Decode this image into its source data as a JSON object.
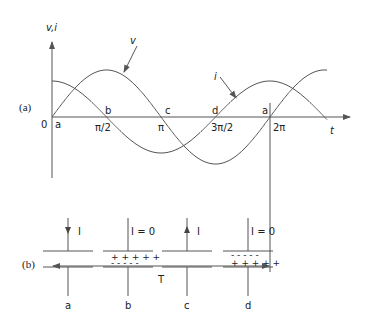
{
  "figure": {
    "part_a": {
      "label": "(a)",
      "y_axis_label": "v,i",
      "x_axis_label": "t",
      "origin_label": "0",
      "curve_labels": {
        "voltage": "v",
        "current": "i"
      },
      "x_ticks": [
        "π/2",
        "π",
        "3π/2",
        "2π"
      ],
      "point_labels": [
        "a",
        "b",
        "c",
        "d",
        "a"
      ],
      "period_label": "T"
    },
    "part_b": {
      "label": "(b)",
      "capacitors": [
        {
          "name": "a",
          "current_label": "I",
          "arrow": "down",
          "top_charges": "",
          "bottom_charges": ""
        },
        {
          "name": "b",
          "current_label": "I = 0",
          "arrow": "none",
          "top_charges": "+ + + + +",
          "bottom_charges": "- - - - -"
        },
        {
          "name": "c",
          "current_label": "I",
          "arrow": "up",
          "top_charges": "",
          "bottom_charges": ""
        },
        {
          "name": "d",
          "current_label": "I = 0",
          "arrow": "none",
          "top_charges": "- - - - -",
          "bottom_charges": "+ + + + +"
        }
      ]
    }
  },
  "colors": {
    "line": "#555555",
    "text": "#222222"
  }
}
